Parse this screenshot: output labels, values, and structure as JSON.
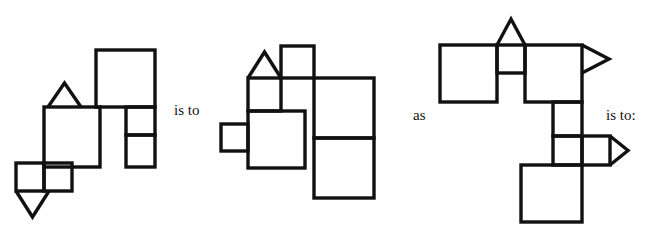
{
  "page": {
    "type": "visual-analogy-puzzle",
    "width": 659,
    "height": 237,
    "background_color": "#ffffff",
    "stroke_color": "#111111"
  },
  "connectors": {
    "first": "is to",
    "second": "as",
    "third": "is to:"
  },
  "figures": [
    {
      "id": "figure-a",
      "label": "A",
      "shapes": [
        {
          "name": "large-square-top-right",
          "type": "square",
          "x": 96,
          "y": 50,
          "w": 59,
          "h": 57
        },
        {
          "name": "medium-square-center",
          "type": "square",
          "x": 44,
          "y": 107,
          "w": 56,
          "h": 60
        },
        {
          "name": "small-rect-upper-right",
          "type": "rect",
          "x": 126,
          "y": 107,
          "w": 29,
          "h": 28
        },
        {
          "name": "small-rect-lower-right",
          "type": "rect",
          "x": 126,
          "y": 135,
          "w": 29,
          "h": 32
        },
        {
          "name": "small-square-bottom-left",
          "type": "square",
          "x": 16,
          "y": 163,
          "w": 28,
          "h": 28
        },
        {
          "name": "small-square-bottom-right",
          "type": "square",
          "x": 44,
          "y": 163,
          "w": 28,
          "h": 28
        },
        {
          "name": "triangle-up-on-center-square",
          "type": "triangle-up",
          "x": 48,
          "y": 83,
          "w": 33,
          "h": 24
        },
        {
          "name": "triangle-down-below-small-square",
          "type": "triangle-down",
          "x": 16,
          "y": 191,
          "w": 33,
          "h": 26
        }
      ]
    },
    {
      "id": "figure-b",
      "label": "B",
      "shapes": [
        {
          "name": "small-square-top-right",
          "type": "square",
          "x": 281,
          "y": 46,
          "w": 33,
          "h": 32
        },
        {
          "name": "small-square-under-triangle",
          "type": "square",
          "x": 248,
          "y": 78,
          "w": 33,
          "h": 33
        },
        {
          "name": "medium-square-center",
          "type": "square",
          "x": 248,
          "y": 111,
          "w": 57,
          "h": 57
        },
        {
          "name": "small-square-left-tab",
          "type": "square",
          "x": 221,
          "y": 124,
          "w": 27,
          "h": 27
        },
        {
          "name": "tall-rect-upper-right",
          "type": "rect",
          "x": 314,
          "y": 78,
          "w": 60,
          "h": 60
        },
        {
          "name": "tall-rect-lower-right",
          "type": "rect",
          "x": 314,
          "y": 138,
          "w": 60,
          "h": 60
        },
        {
          "name": "triangle-up-on-small-square",
          "type": "triangle-up",
          "x": 248,
          "y": 52,
          "w": 33,
          "h": 26
        }
      ]
    },
    {
      "id": "figure-c",
      "label": "C",
      "shapes": [
        {
          "name": "large-square-top-left",
          "type": "square",
          "x": 440,
          "y": 45,
          "w": 57,
          "h": 57
        },
        {
          "name": "small-square-top-middle",
          "type": "square",
          "x": 497,
          "y": 45,
          "w": 28,
          "h": 28
        },
        {
          "name": "large-square-top-right",
          "type": "square",
          "x": 525,
          "y": 45,
          "w": 57,
          "h": 57
        },
        {
          "name": "small-rect-below-right",
          "type": "rect",
          "x": 553,
          "y": 102,
          "w": 29,
          "h": 34
        },
        {
          "name": "small-square-mid",
          "type": "square",
          "x": 553,
          "y": 136,
          "w": 29,
          "h": 29
        },
        {
          "name": "small-square-mid-right",
          "type": "square",
          "x": 582,
          "y": 136,
          "w": 28,
          "h": 29
        },
        {
          "name": "large-square-bottom",
          "type": "square",
          "x": 521,
          "y": 165,
          "w": 61,
          "h": 57
        },
        {
          "name": "triangle-up-top",
          "type": "triangle-up",
          "x": 497,
          "y": 19,
          "w": 28,
          "h": 26
        },
        {
          "name": "triangle-right-top",
          "type": "triangle-right",
          "x": 582,
          "y": 45,
          "w": 27,
          "h": 28
        },
        {
          "name": "triangle-right-mid",
          "type": "triangle-right",
          "x": 610,
          "y": 136,
          "w": 18,
          "h": 29
        }
      ]
    }
  ]
}
